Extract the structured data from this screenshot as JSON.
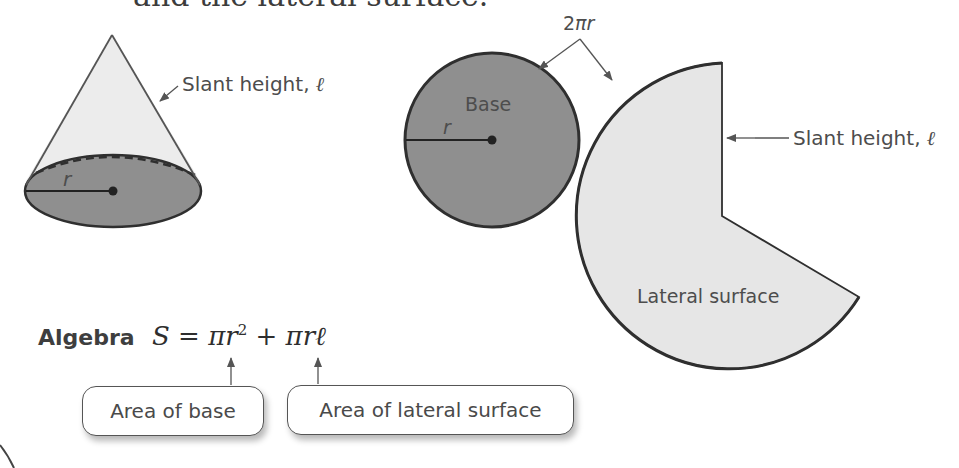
{
  "heading": {
    "text": "and the lateral surface."
  },
  "cone": {
    "slant_label": "Slant height, ",
    "slant_symbol": "ℓ",
    "radius_label": "r"
  },
  "net": {
    "circumference_label_num": "2",
    "circumference_label_pi": "π",
    "circumference_label_r": "r",
    "base_label": "Base",
    "radius_label": "r",
    "slant_label": "Slant height, ",
    "slant_symbol": "ℓ",
    "lateral_label": "Lateral surface"
  },
  "algebra": {
    "label": "Algebra",
    "formula_lhs": "S",
    "formula_eq": " = ",
    "term1": "πr",
    "term1_exp": "2",
    "plus": " + ",
    "term2": "πrℓ"
  },
  "annotations": {
    "base_box": "Area of base",
    "lateral_box": "Area of lateral surface"
  },
  "colors": {
    "base_fill": "#8f8f8f",
    "lateral_fill": "#e6e6e6",
    "outline": "#2f2f2f",
    "text": "#4d4d4d"
  }
}
